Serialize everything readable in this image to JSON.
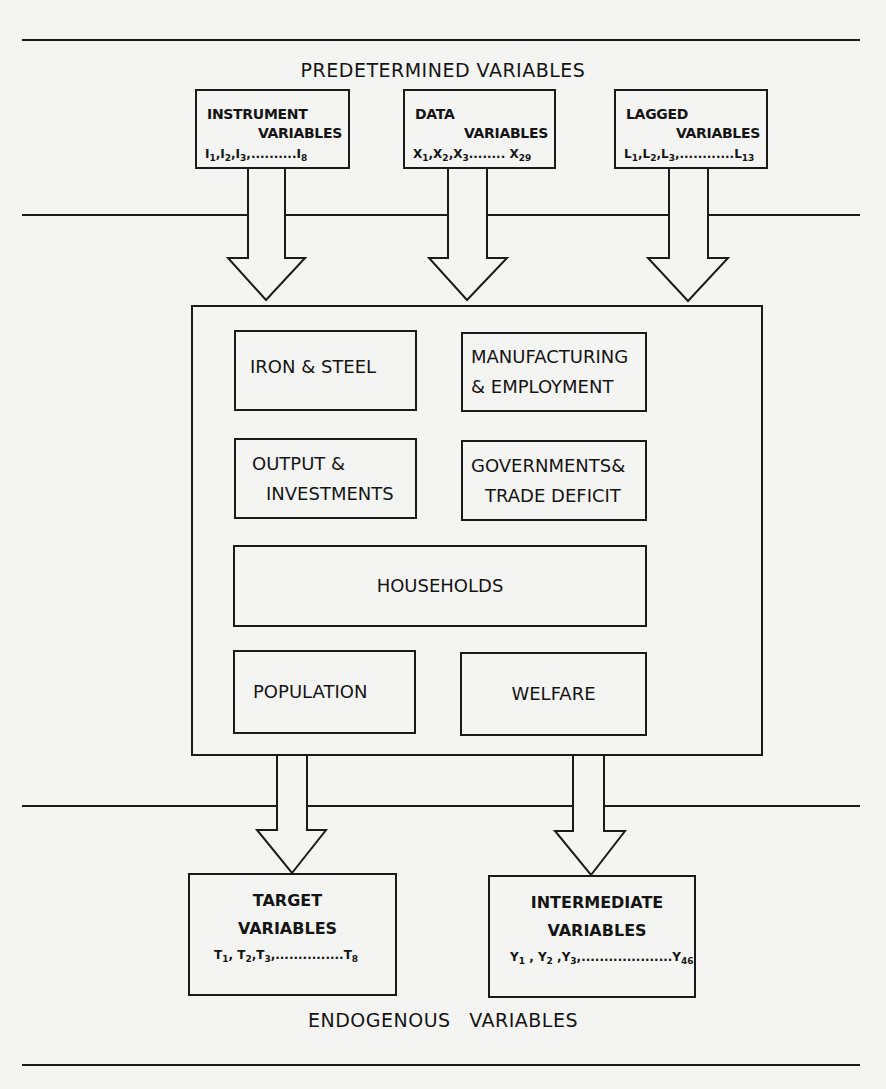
{
  "diagram": {
    "sections": {
      "top_label": "PREDETERMINED VARIABLES",
      "bottom_label": "ENDOGENOUS VARIABLES"
    },
    "inputs": [
      {
        "id": "instrument",
        "line1": "INSTRUMENT",
        "line2": "VARIABLES",
        "vars": {
          "first": "I",
          "s1": "1",
          "s2": "2",
          "s3": "3",
          "sep": ",",
          "dots": "..........",
          "last": "I",
          "sn": "8"
        }
      },
      {
        "id": "data",
        "line1": "DATA",
        "line2": "VARIABLES",
        "vars": {
          "first": "X",
          "s1": "1",
          "s2": "2",
          "s3": "3",
          "sep": ",",
          "dots": "........",
          "last": "X",
          "sn": "29"
        }
      },
      {
        "id": "lagged",
        "line1": "LAGGED",
        "line2": "VARIABLES",
        "vars": {
          "first": "L",
          "s1": "1",
          "s2": "2",
          "s3": "3",
          "sep": ",",
          "dots": "............",
          "last": "L",
          "sn": "13"
        }
      }
    ],
    "model_blocks": [
      {
        "id": "iron-steel",
        "label": "IRON & STEEL"
      },
      {
        "id": "manufacturing-employment",
        "line1": "MANUFACTURING",
        "line2": "& EMPLOYMENT"
      },
      {
        "id": "output-investments",
        "line1": "OUTPUT &",
        "line2": "INVESTMENTS"
      },
      {
        "id": "governments-trade",
        "line1": "GOVERNMENTS&",
        "line2": "TRADE DEFICIT"
      },
      {
        "id": "households",
        "label": "HOUSEHOLDS"
      },
      {
        "id": "population",
        "label": "POPULATION"
      },
      {
        "id": "welfare",
        "label": "WELFARE"
      }
    ],
    "outputs": [
      {
        "id": "target",
        "line1": "TARGET",
        "line2": "VARIABLES",
        "vars": {
          "first": "T",
          "s1": "1",
          "s2": "2",
          "s3": "3",
          "sep": ",",
          "dots": "...............",
          "last": "T",
          "sn": "8"
        }
      },
      {
        "id": "intermediate",
        "line1": "INTERMEDIATE",
        "line2": "VARIABLES",
        "vars": {
          "first": "Y",
          "s1": "1",
          "s2": "2",
          "s3": "3",
          "sep": ",",
          "dots": "....................",
          "last": "Y",
          "sn": "46"
        }
      }
    ],
    "colors": {
      "ink": "#1a1a1a",
      "paper": "#f4f4f2"
    }
  }
}
